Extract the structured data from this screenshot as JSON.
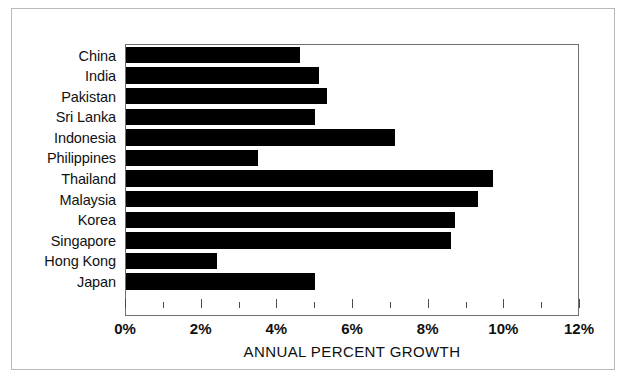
{
  "chart_data": {
    "type": "bar",
    "orientation": "horizontal",
    "title": "",
    "xlabel": "ANNUAL PERCENT GROWTH",
    "ylabel": "",
    "xlim": [
      0,
      12
    ],
    "xtick_step_major": 2,
    "xtick_step_minor": 1,
    "xtick_labels": [
      "0%",
      "2%",
      "4%",
      "6%",
      "8%",
      "10%",
      "12%"
    ],
    "xtick_values": [
      0,
      2,
      4,
      6,
      8,
      10,
      12
    ],
    "unit": "%",
    "grid": false,
    "legend": false,
    "bar_color": "#000000",
    "categories": [
      "China",
      "India",
      "Pakistan",
      "Sri Lanka",
      "Indonesia",
      "Philippines",
      "Thailand",
      "Malaysia",
      "Korea",
      "Singapore",
      "Hong Kong",
      "Japan"
    ],
    "values": [
      4.6,
      5.1,
      5.3,
      5.0,
      7.1,
      3.5,
      9.7,
      9.3,
      8.7,
      8.6,
      2.4,
      5.0
    ]
  }
}
